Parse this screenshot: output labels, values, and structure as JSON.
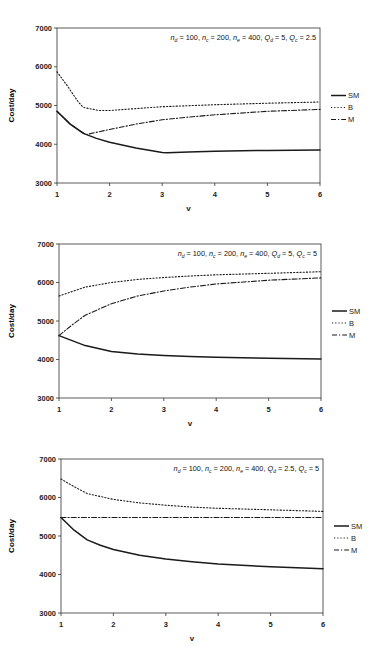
{
  "chart_data": [
    {
      "type": "line",
      "title": "",
      "annotation": {
        "parts": [
          {
            "sym": "n",
            "sub": "d",
            "val": " = 100, "
          },
          {
            "sym": "n",
            "sub": "c",
            "val": " = 200, "
          },
          {
            "sym": "n",
            "sub": "e",
            "val": " = 400, "
          },
          {
            "sym": "Q",
            "sub": "d",
            "val": " = 5, "
          },
          {
            "sym": "Q",
            "sub": "c",
            "val": " = 2.5"
          }
        ]
      },
      "xlabel": "v",
      "ylabel": "Cost/day",
      "xlim": [
        1,
        6
      ],
      "ylim": [
        3000,
        7000
      ],
      "xticks": [
        1,
        2,
        3,
        4,
        5,
        6
      ],
      "yticks": [
        3000,
        4000,
        5000,
        6000,
        7000
      ],
      "grid": false,
      "legend_position": "right",
      "box": {
        "x0": 57,
        "x1": 320,
        "y0": 28,
        "y1": 183
      },
      "series": [
        {
          "name": "SM",
          "style": "solid",
          "x": [
            1,
            1.25,
            1.5,
            1.75,
            2,
            2.5,
            3,
            3.1,
            3.5,
            4,
            5,
            6
          ],
          "y": [
            4850,
            4520,
            4280,
            4150,
            4050,
            3900,
            3790,
            3780,
            3800,
            3820,
            3840,
            3850
          ]
        },
        {
          "name": "B",
          "style": "dotted",
          "x": [
            1,
            1.2,
            1.4,
            1.5,
            1.8,
            2,
            2.5,
            3,
            4,
            5,
            6
          ],
          "y": [
            5870,
            5500,
            5100,
            4950,
            4870,
            4870,
            4920,
            4970,
            5020,
            5060,
            5090
          ]
        },
        {
          "name": "M",
          "style": "dashdot",
          "x": [
            1,
            1.25,
            1.55,
            2,
            2.5,
            3,
            3.5,
            4,
            5,
            6
          ],
          "y": [
            4850,
            4520,
            4250,
            4380,
            4520,
            4630,
            4700,
            4760,
            4850,
            4900
          ]
        }
      ]
    },
    {
      "type": "line",
      "title": "",
      "annotation": {
        "parts": [
          {
            "sym": "n",
            "sub": "d",
            "val": " = 100, "
          },
          {
            "sym": "n",
            "sub": "c",
            "val": " = 200, "
          },
          {
            "sym": "n",
            "sub": "e",
            "val": " = 400, "
          },
          {
            "sym": "Q",
            "sub": "d",
            "val": " = 5, "
          },
          {
            "sym": "Q",
            "sub": "c",
            "val": " = 5"
          }
        ]
      },
      "xlabel": "v",
      "ylabel": "Cost/day",
      "xlim": [
        1,
        6
      ],
      "ylim": [
        3000,
        7000
      ],
      "xticks": [
        1,
        2,
        3,
        4,
        5,
        6
      ],
      "yticks": [
        3000,
        4000,
        5000,
        6000,
        7000
      ],
      "grid": false,
      "legend_position": "right",
      "box": {
        "x0": 59,
        "x1": 321,
        "y0": 244,
        "y1": 398
      },
      "series": [
        {
          "name": "SM",
          "style": "solid",
          "x": [
            1,
            1.5,
            2,
            2.5,
            3,
            3.5,
            4,
            5,
            6
          ],
          "y": [
            4620,
            4360,
            4210,
            4140,
            4100,
            4075,
            4060,
            4030,
            4010
          ]
        },
        {
          "name": "B",
          "style": "dotted",
          "x": [
            1,
            1.5,
            2,
            2.5,
            3,
            3.5,
            4,
            5,
            6
          ],
          "y": [
            5650,
            5880,
            6000,
            6080,
            6130,
            6170,
            6200,
            6240,
            6280
          ]
        },
        {
          "name": "M",
          "style": "dashdot",
          "x": [
            1,
            1.25,
            1.5,
            2,
            2.5,
            3,
            3.5,
            4,
            5,
            6
          ],
          "y": [
            4620,
            4900,
            5150,
            5450,
            5650,
            5780,
            5880,
            5960,
            6060,
            6120
          ]
        }
      ]
    },
    {
      "type": "line",
      "title": "",
      "annotation": {
        "parts": [
          {
            "sym": "n",
            "sub": "d",
            "val": " = 100, "
          },
          {
            "sym": "n",
            "sub": "c",
            "val": " = 200, "
          },
          {
            "sym": "n",
            "sub": "e",
            "val": " = 400, "
          },
          {
            "sym": "Q",
            "sub": "d",
            "val": " = 2.5, "
          },
          {
            "sym": "Q",
            "sub": "c",
            "val": " = 5"
          }
        ]
      },
      "xlabel": "v",
      "ylabel": "Cost/day",
      "xlim": [
        1,
        6
      ],
      "ylim": [
        3000,
        7000
      ],
      "xticks": [
        1,
        2,
        3,
        4,
        5,
        6
      ],
      "yticks": [
        3000,
        4000,
        5000,
        6000,
        7000
      ],
      "grid": false,
      "legend_position": "right",
      "box": {
        "x0": 61,
        "x1": 323,
        "y0": 459,
        "y1": 613
      },
      "series": [
        {
          "name": "SM",
          "style": "solid",
          "x": [
            1,
            1.25,
            1.5,
            1.75,
            2,
            2.5,
            3,
            3.5,
            4,
            5,
            6
          ],
          "y": [
            5480,
            5150,
            4900,
            4760,
            4650,
            4500,
            4400,
            4330,
            4270,
            4200,
            4150
          ]
        },
        {
          "name": "B",
          "style": "dotted",
          "x": [
            1,
            1.25,
            1.5,
            2,
            2.5,
            3,
            3.5,
            4,
            5,
            6
          ],
          "y": [
            6480,
            6280,
            6100,
            5950,
            5860,
            5800,
            5750,
            5720,
            5680,
            5640
          ]
        },
        {
          "name": "M",
          "style": "dashdot",
          "x": [
            1,
            2,
            3,
            4,
            5,
            6
          ],
          "y": [
            5480,
            5480,
            5480,
            5480,
            5480,
            5480
          ]
        }
      ]
    }
  ],
  "legend": {
    "items": [
      {
        "name": "SM",
        "style": "solid"
      },
      {
        "name": "B",
        "style": "dotted"
      },
      {
        "name": "M",
        "style": "dashdot"
      }
    ]
  },
  "colors": {
    "line": "#1a1a1a",
    "frame": "#333333",
    "background": "#ffffff"
  }
}
